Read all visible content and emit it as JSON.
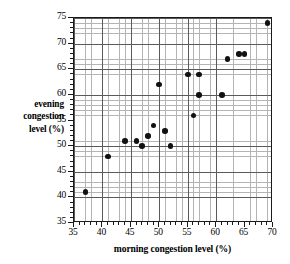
{
  "chart_data": {
    "type": "scatter",
    "title": "",
    "xlabel": "morning congestion level (%)",
    "ylabel_lines": [
      "evening",
      "congestion",
      "level (%)"
    ],
    "ylabel": "evening congestion level (%)",
    "xlim": [
      35,
      70
    ],
    "ylim": [
      35,
      75
    ],
    "xticks": [
      35,
      40,
      45,
      50,
      55,
      60,
      65,
      70
    ],
    "yticks": [
      35,
      40,
      45,
      50,
      55,
      60,
      65,
      70,
      75
    ],
    "x_major_step": 5,
    "y_major_step": 5,
    "x_minor_step": 1,
    "y_minor_step": 1,
    "grid": true,
    "grid_minor": true,
    "legend": null,
    "marker": "filled-circle",
    "marker_color": "#111111",
    "points": [
      {
        "x": 37,
        "y": 41
      },
      {
        "x": 41,
        "y": 48
      },
      {
        "x": 44,
        "y": 51
      },
      {
        "x": 46,
        "y": 51
      },
      {
        "x": 47,
        "y": 50
      },
      {
        "x": 48,
        "y": 52
      },
      {
        "x": 49,
        "y": 54
      },
      {
        "x": 50,
        "y": 62
      },
      {
        "x": 51,
        "y": 53
      },
      {
        "x": 52,
        "y": 50
      },
      {
        "x": 55,
        "y": 64
      },
      {
        "x": 56,
        "y": 56
      },
      {
        "x": 57,
        "y": 64
      },
      {
        "x": 57,
        "y": 60
      },
      {
        "x": 61,
        "y": 60
      },
      {
        "x": 62,
        "y": 67
      },
      {
        "x": 64,
        "y": 68
      },
      {
        "x": 65,
        "y": 68
      },
      {
        "x": 69,
        "y": 74
      }
    ]
  }
}
